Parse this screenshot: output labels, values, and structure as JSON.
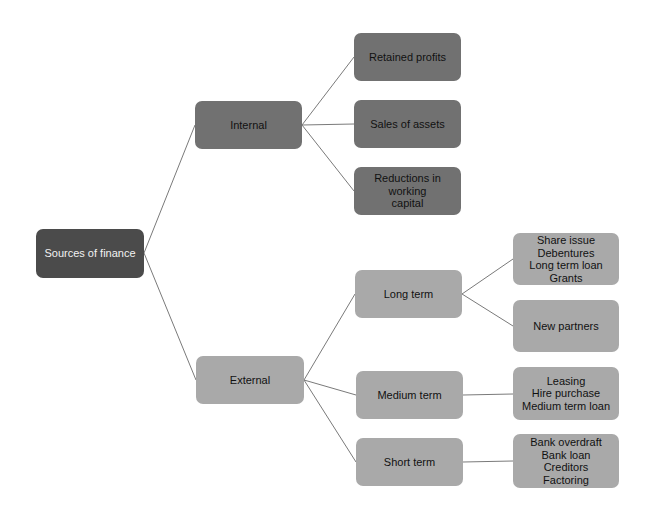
{
  "diagram": {
    "colors": {
      "root": "#4b4b4b",
      "internal": "#717171",
      "external": "#a9a9a9",
      "connector": "#7a7a7a",
      "background": "#ffffff"
    },
    "root": {
      "label": "Sources of finance"
    },
    "internal": {
      "label": "Internal",
      "children": [
        {
          "label": "Retained profits"
        },
        {
          "label": "Sales of assets"
        },
        {
          "label": "Reductions in working\ncapital"
        }
      ]
    },
    "external": {
      "label": "External",
      "children": [
        {
          "label": "Long term",
          "items": [
            {
              "label": "Share issue\nDebentures\nLong term loan\nGrants"
            },
            {
              "label": "New partners"
            }
          ]
        },
        {
          "label": "Medium term",
          "items": [
            {
              "label": "Leasing\nHire purchase\nMedium term loan"
            }
          ]
        },
        {
          "label": "Short term",
          "items": [
            {
              "label": "Bank overdraft\nBank loan\nCreditors\nFactoring"
            }
          ]
        }
      ]
    }
  }
}
